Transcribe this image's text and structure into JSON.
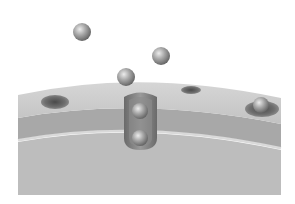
{
  "diagram": {
    "colors": {
      "background": "#ffffff",
      "surface_top": "#c9c9c9",
      "surface_band": "#a9a9a9",
      "surface_block": "#bdbdbd",
      "pore": "#6f6f6f",
      "particle": "#9a9a9a",
      "particle_highlight": "#e6e6e6"
    },
    "particles": [
      {
        "id": "particle-free-1",
        "state": "free"
      },
      {
        "id": "particle-free-2",
        "state": "free"
      },
      {
        "id": "particle-entering",
        "state": "entering"
      },
      {
        "id": "particle-in-channel-upper",
        "state": "in-channel"
      },
      {
        "id": "particle-in-channel-lower",
        "state": "in-channel"
      },
      {
        "id": "particle-in-pore-right",
        "state": "in-pore"
      }
    ],
    "pores": [
      {
        "id": "pore-left"
      },
      {
        "id": "pore-center-right"
      },
      {
        "id": "pore-right"
      }
    ]
  }
}
